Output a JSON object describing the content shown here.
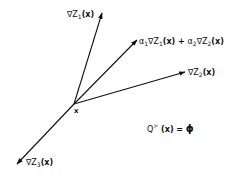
{
  "diagram": {
    "origin": {
      "x": 74,
      "y": 104,
      "label": "x"
    },
    "vectors": [
      {
        "id": "grad-z1",
        "label": "∇Z1(x)",
        "tip": {
          "x": 102,
          "y": 13
        }
      },
      {
        "id": "combo",
        "label": "α1∇Z1(x) + α2∇Z2(x)",
        "tip": {
          "x": 137,
          "y": 40
        }
      },
      {
        "id": "grad-z2",
        "label": "∇Z2(x)",
        "tip": {
          "x": 185,
          "y": 72
        }
      },
      {
        "id": "grad-z3",
        "label": "∇Z3(x)",
        "tip": {
          "x": 17,
          "y": 164
        }
      }
    ],
    "equation": "Q>(x) = ϕ",
    "stroke_color": "#111111"
  },
  "labels": {
    "z1": {
      "nabla": "∇Z",
      "sub": "1",
      "arg": "(x)"
    },
    "combo": {
      "a1": "α",
      "a1_sub": "1",
      "nabla1": "∇Z",
      "z1_sub": "1",
      "arg1": "(x) + ",
      "a2": "α",
      "a2_sub": "2",
      "nabla2": "∇Z",
      "z2_sub": "2",
      "arg2": "(x)"
    },
    "z2": {
      "nabla": "∇Z",
      "sub": "2",
      "arg": "(x)"
    },
    "z3": {
      "nabla": "∇Z",
      "sub": "3",
      "arg": "(x)"
    },
    "origin": "x",
    "equation": {
      "q": "Q",
      "sup": ">",
      "arg": " (x) = ",
      "phi": "ϕ"
    }
  }
}
